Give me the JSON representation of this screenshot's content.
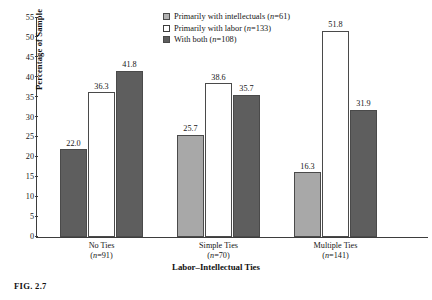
{
  "caption": "FIG. 2.7",
  "legend": {
    "position": "top-right",
    "entries": [
      {
        "label": "Primarily with intellectuals (n=61)",
        "swatch": "swatch-light-gray",
        "color": "#b2b2b2"
      },
      {
        "label": "Primarily with labor (n=133)",
        "swatch": "swatch-white",
        "color": "#ffffff"
      },
      {
        "label": "With both (n=108)",
        "swatch": "swatch-dark-gray",
        "color": "#5e5e5e"
      }
    ]
  },
  "chart_data": {
    "type": "bar",
    "title": "",
    "xlabel": "Labor–Intellectual Ties",
    "ylabel": "Percentage of Sample",
    "ylim": [
      0,
      55
    ],
    "yticks": [
      0,
      5,
      10,
      15,
      20,
      25,
      30,
      35,
      40,
      45,
      50,
      55
    ],
    "grid": false,
    "legend_position": "top-right",
    "categories": [
      "No Ties",
      "Simple Ties",
      "Multiple Ties"
    ],
    "category_labels": [
      {
        "name": "No Ties",
        "n": "(n=91)"
      },
      {
        "name": "Simple Ties",
        "n": "(n=70)"
      },
      {
        "name": "Multiple Ties",
        "n": "(n=141)"
      }
    ],
    "series": [
      {
        "name": "Primarily with intellectuals (n=61)",
        "values": [
          22.0,
          25.7,
          16.3
        ],
        "color": "#b2b2b2"
      },
      {
        "name": "Primarily with labor (n=133)",
        "values": [
          36.3,
          38.6,
          51.8
        ],
        "color": "#ffffff"
      },
      {
        "name": "With both (n=108)",
        "values": [
          41.8,
          35.7,
          31.9
        ],
        "color": "#5e5e5e"
      }
    ],
    "bar_labels": [
      [
        "22.0",
        "36.3",
        "41.8"
      ],
      [
        "25.7",
        "38.6",
        "35.7"
      ],
      [
        "16.3",
        "51.8",
        "31.9"
      ]
    ]
  }
}
